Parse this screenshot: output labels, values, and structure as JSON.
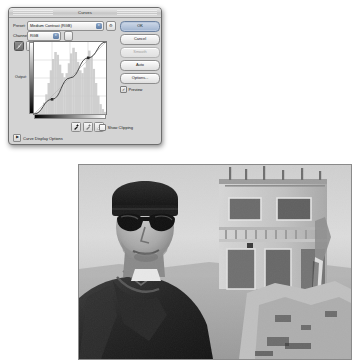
{
  "dialog": {
    "title": "Curves",
    "preset": {
      "label": "Preset:",
      "value": "Medium Contrast (RGB)",
      "gear_icon": "gear-icon",
      "options": [
        "Default",
        "Color Negative (RGB)",
        "Cross Process (RGB)",
        "Darker (RGB)",
        "Increase Contrast (RGB)",
        "Lighter (RGB)",
        "Linear Contrast (RGB)",
        "Medium Contrast (RGB)",
        "Negative (RGB)",
        "Strong Contrast (RGB)",
        "Custom"
      ]
    },
    "channel": {
      "label": "Channel:",
      "value": "RGB",
      "options": [
        "RGB",
        "Red",
        "Green",
        "Blue"
      ]
    },
    "curve_tools": [
      {
        "name": "edit-points-tool",
        "icon": "curve-points-icon",
        "active": true
      },
      {
        "name": "pencil-draw-tool",
        "icon": "pencil-icon",
        "active": false
      }
    ],
    "graph": {
      "output_label": "Output:",
      "input_label": "Input:",
      "grid_divisions": 4
    },
    "eyedroppers": [
      {
        "name": "set-black-point",
        "icon": "eyedropper-black-icon"
      },
      {
        "name": "set-gray-point",
        "icon": "eyedropper-gray-icon"
      },
      {
        "name": "set-white-point",
        "icon": "eyedropper-white-icon"
      }
    ],
    "show_clipping": {
      "label": "Show Clipping",
      "checked": false
    },
    "curve_display_options": {
      "label": "Curve Display Options",
      "expanded": false,
      "triangle": "▶"
    },
    "buttons": {
      "ok": "OK",
      "cancel": "Cancel",
      "smooth": "Smooth",
      "auto": "Auto",
      "options": "Options...",
      "preview_label": "Preview",
      "preview_checked": true,
      "smooth_disabled": true
    },
    "colors": {
      "dialog_bg": "#d4d4d4",
      "default_button": "#9fb3cf",
      "curve_line": "#4a4a4a",
      "histogram": "#cfcfcf"
    }
  },
  "chart_data": {
    "type": "line",
    "xlabel": "Input",
    "ylabel": "Output",
    "xlim": [
      0,
      255
    ],
    "ylim": [
      0,
      255
    ],
    "grid": true,
    "grid_divisions": 4,
    "legend": "none",
    "series": [
      {
        "name": "Medium Contrast (RGB)",
        "x": [
          0,
          64,
          128,
          192,
          255
        ],
        "y": [
          0,
          52,
          128,
          199,
          255
        ]
      }
    ],
    "control_points": [
      {
        "input": 64,
        "output": 52
      },
      {
        "input": 192,
        "output": 199
      }
    ],
    "baseline": {
      "name": "identity-diagonal",
      "x": [
        0,
        255
      ],
      "y": [
        0,
        255
      ]
    },
    "histogram": {
      "bins": 32,
      "values": [
        2,
        3,
        5,
        9,
        16,
        28,
        44,
        62,
        78,
        88,
        84,
        70,
        58,
        52,
        58,
        72,
        86,
        94,
        88,
        74,
        62,
        58,
        66,
        80,
        90,
        82,
        64,
        44,
        26,
        14,
        7,
        3
      ]
    }
  },
  "photo": {
    "name": "black-and-white-portrait",
    "description": "Man in dark beanie and black sunglasses in front of unfinished concrete building",
    "grayscale": true
  }
}
